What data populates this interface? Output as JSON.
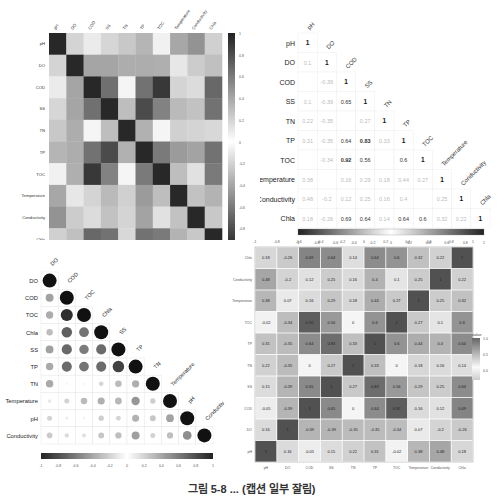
{
  "chart_data": [
    {
      "type": "heatmap",
      "panel": "top-left",
      "title": "",
      "variables": [
        "pH",
        "DO",
        "COD",
        "SS",
        "TN",
        "TP",
        "TOC",
        "Temperature",
        "Conductivity",
        "Chla"
      ],
      "colorbar": {
        "ticks": [
          "1",
          "0.8",
          "0.6",
          "0.4",
          "0.2",
          "0",
          "-0.2",
          "-0.4",
          "-0.6",
          "-0.8"
        ],
        "range": [
          -1,
          1
        ],
        "orientation": "vertical"
      },
      "scale": "grayscale-diverging"
    },
    {
      "type": "table",
      "panel": "top-right",
      "style": "lower-triangle correlation numbers",
      "variables": [
        "pH",
        "DO",
        "COD",
        "SS",
        "TN",
        "TP",
        "TOC",
        "Temperature",
        "Conductivity",
        "Chla"
      ],
      "rows": [
        [
          "1"
        ],
        [
          "0.1",
          "1"
        ],
        [
          "",
          "-0.39",
          "1"
        ],
        [
          "0.1",
          "-0.39",
          "0.65",
          "1"
        ],
        [
          "0.22",
          "-0.35",
          "",
          "0.27",
          "1"
        ],
        [
          "0.31",
          "-0.35",
          "0.64",
          "0.83",
          "0.33",
          "1"
        ],
        [
          "",
          "-0.34",
          "0.92",
          "0.56",
          "",
          "0.6",
          "1"
        ],
        [
          "0.38",
          "",
          "0.16",
          "0.29",
          "0.18",
          "0.44",
          "0.27",
          "1"
        ],
        [
          "0.48",
          "-0.2",
          "0.12",
          "0.25",
          "0.16",
          "0.4",
          "",
          "0.25",
          "1"
        ],
        [
          "0.18",
          "-0.26",
          "0.69",
          "0.64",
          "0.14",
          "0.64",
          "0.6",
          "0.32",
          "0.22",
          "1"
        ]
      ],
      "colorbar": {
        "ticks": [
          "-1",
          "-0.8",
          "-0.6",
          "-0.4",
          "-0.2",
          "0",
          "0.2",
          "0.4",
          "0.6",
          "0.8",
          "1"
        ],
        "orientation": "horizontal"
      }
    },
    {
      "type": "scatter",
      "panel": "bottom-left",
      "style": "circle correlation plot (lower triangle)",
      "variables": [
        "DO",
        "COD",
        "TOC",
        "Chla",
        "SS",
        "TP",
        "TN",
        "Temperature",
        "pH",
        "Conductivity"
      ],
      "top_labels": [
        "DO",
        "COD",
        "TOC",
        "Chla",
        "SS",
        "TP",
        "TN",
        "Temperature",
        "pH",
        "Conductiv"
      ],
      "colorbar": {
        "ticks": [
          "-1",
          "-0.8",
          "-0.6",
          "-0.4",
          "-0.2",
          "0",
          "0.2",
          "0.4",
          "0.6",
          "0.8",
          "1"
        ],
        "orientation": "horizontal"
      }
    },
    {
      "type": "heatmap",
      "panel": "bottom-right",
      "x_categories": [
        "pH",
        "DO",
        "COD",
        "SS",
        "TN",
        "TP",
        "TOC",
        "Temperature",
        "Conductivity",
        "Chla"
      ],
      "y_categories_top_to_bottom": [
        "Chla",
        "Conductivity",
        "Temperature",
        "TOC",
        "TP",
        "TN",
        "SS",
        "COD",
        "DO",
        "pH"
      ],
      "values": [
        [
          "0.18",
          "-0.26",
          "0.69",
          "0.64",
          "0.14",
          "0.64",
          "0.6",
          "0.32",
          "0.22",
          "1"
        ],
        [
          "0.48",
          "-0.2",
          "0.12",
          "0.25",
          "0.16",
          "0.4",
          "0.1",
          "0.25",
          "1",
          "0.22"
        ],
        [
          "0.38",
          "0.07",
          "0.16",
          "0.29",
          "0.18",
          "0.44",
          "0.27",
          "1",
          "0.25",
          "0.32"
        ],
        [
          "-0.02",
          "-0.34",
          "0.92",
          "0.56",
          "0",
          "0.6",
          "1",
          "0.27",
          "0.1",
          "0.6"
        ],
        [
          "0.31",
          "-0.35",
          "0.64",
          "0.83",
          "0.33",
          "1",
          "0.6",
          "0.44",
          "0.4",
          "0.64"
        ],
        [
          "0.22",
          "-0.35",
          "0",
          "0.27",
          "1",
          "0.33",
          "0",
          "0.18",
          "0.16",
          "0.14"
        ],
        [
          "0.15",
          "-0.39",
          "0.65",
          "1",
          "0.27",
          "0.83",
          "0.56",
          "0.29",
          "0.25",
          "0.64"
        ],
        [
          "-0.05",
          "-0.39",
          "1",
          "0.65",
          "0",
          "0.64",
          "0.92",
          "0.16",
          "0.12",
          "0.69"
        ],
        [
          "0.16",
          "1",
          "-0.39",
          "-0.39",
          "-0.35",
          "-0.35",
          "-0.34",
          "0.07",
          "-0.2",
          "-0.26"
        ],
        [
          "1",
          "0.16",
          "-0.05",
          "0.15",
          "0.22",
          "0.31",
          "-0.02",
          "0.38",
          "0.48",
          "0.18"
        ]
      ],
      "top_axis_ticks": [
        "-1",
        "-0.8",
        "-0.6",
        "-0.4",
        "-0.2",
        "0",
        "0.2",
        "0.4",
        "0.6",
        "0.8",
        "1"
      ],
      "legend": {
        "title": "value",
        "ticks": [
          "1.0",
          "0.5",
          "0.0"
        ]
      }
    }
  ],
  "caption": "그림 5-8 ... (캡션 일부 잘림)"
}
